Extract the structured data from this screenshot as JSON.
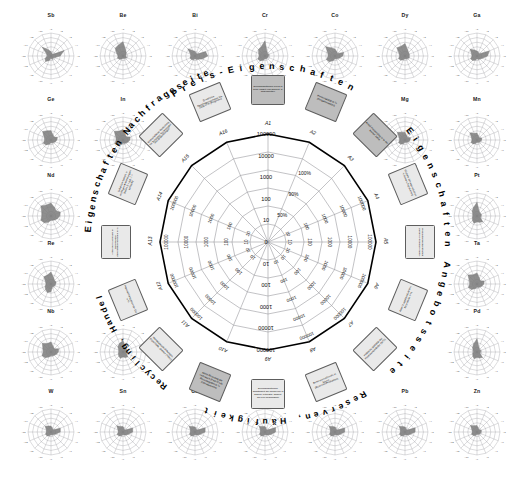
{
  "figure": {
    "caption": ""
  },
  "center_chart": {
    "quadrants": [
      {
        "id": "price",
        "label": "Preis-Eigenschaften"
      },
      {
        "id": "supply",
        "label": "Eigenschaften Angebotsseite"
      },
      {
        "id": "reserves",
        "label": "Reserven, Häufigkeit"
      },
      {
        "id": "recycling",
        "label": "Recycling, Handel"
      },
      {
        "id": "demand",
        "label": "Eigenschaften Nachfrageseite"
      }
    ],
    "axes": [
      {
        "id": "A1",
        "tick": "A1",
        "shade": "dark",
        "text": "Durchschnittlicher Preis in 1000 USD/t (log-skaliert, 3-Jahresmittel)"
      },
      {
        "id": "A2",
        "tick": "A2",
        "shade": "dark",
        "text": "Preisvolatilität in % (Dreijahresmittel)"
      },
      {
        "id": "A3",
        "tick": "A3",
        "shade": "dark",
        "text": "Anteil Preisanstieg in % der letzten Jahre"
      },
      {
        "id": "A4",
        "tick": "A4",
        "shade": "light",
        "text": "Globale Jahresproduktion in Tonnen (log-skaliert)"
      },
      {
        "id": "A5",
        "tick": "A5",
        "shade": "light",
        "text": "Produktionskonzentration Länder (Herfindahl-Index)"
      },
      {
        "id": "A6",
        "tick": "A6",
        "shade": "light",
        "text": "Anteil Kuppelproduktion / Beiprodukt in %"
      },
      {
        "id": "A7",
        "tick": "A7",
        "shade": "light",
        "text": "Politische Stabilität der Produzentenländer (WGI)"
      },
      {
        "id": "A8",
        "tick": "A8",
        "shade": "light",
        "text": "Reservenreichweite in Jahren (Reserven/Produktion)"
      },
      {
        "id": "A9",
        "tick": "A9",
        "shade": "light",
        "text": "Durchschnittlicher Schatzwert der Reserven in Jahren (Literatur, basiert, auf 100 beschränkt)"
      },
      {
        "id": "A10",
        "tick": "A10",
        "shade": "dark",
        "text": "Anteil Recycling am Verbrauch (End-of-Life Recyclingrate) in % (Literaturwerte)"
      },
      {
        "id": "A11",
        "tick": "A11",
        "shade": "light",
        "text": "Handelsbeschränkungen, Exportzolle, Quoten (Index)"
      },
      {
        "id": "A12",
        "tick": "A12",
        "shade": "light",
        "text": "Importabhängigkeit der EU in %"
      },
      {
        "id": "A13",
        "tick": "A13",
        "shade": "light",
        "text": "Anteil der Nachfrage in wachsenden Zukunftstechnologien in %"
      },
      {
        "id": "A14",
        "tick": "A14",
        "shade": "light",
        "text": "Substituierbarkeit in wichtigen Anwendungen (Index, 0 = gut, 1 = schlecht)"
      },
      {
        "id": "A15",
        "tick": "A15",
        "shade": "light",
        "text": "Wirtschaftliche Bedeutung für Schlüssel-Technologien und Anwendungen"
      },
      {
        "id": "A16",
        "tick": "A16",
        "shade": "light",
        "text": "Erwartetes Nachfragewachstum bis 2030 in % (Prognose)"
      }
    ],
    "radial_ticks_log": [
      "100000",
      "10000",
      "1000",
      "100",
      "10",
      "0"
    ],
    "radial_ticks_percent": [
      "100%",
      "90%",
      "50%"
    ],
    "radial_ticks_outer": [
      "100000",
      "10000",
      "1000",
      "100",
      "10"
    ]
  },
  "mini_charts": [
    {
      "symbol": "Sb",
      "values": [
        0.18,
        0.12,
        0.1,
        0.62,
        0.4,
        0.18,
        0.12,
        0.16,
        0.1,
        0.22,
        0.34,
        0.28,
        0.16,
        0.2,
        0.55,
        0.3
      ]
    },
    {
      "symbol": "Be",
      "values": [
        0.62,
        0.3,
        0.2,
        0.14,
        0.12,
        0.18,
        0.14,
        0.12,
        0.1,
        0.14,
        0.2,
        0.26,
        0.22,
        0.3,
        0.48,
        0.52
      ]
    },
    {
      "symbol": "Bi",
      "values": [
        0.2,
        0.14,
        0.12,
        0.5,
        0.56,
        0.34,
        0.2,
        0.16,
        0.12,
        0.18,
        0.22,
        0.24,
        0.18,
        0.22,
        0.44,
        0.26
      ]
    },
    {
      "symbol": "Cr",
      "values": [
        0.66,
        0.22,
        0.16,
        0.18,
        0.16,
        0.14,
        0.12,
        0.14,
        0.12,
        0.2,
        0.3,
        0.34,
        0.26,
        0.3,
        0.4,
        0.44
      ]
    },
    {
      "symbol": "Co",
      "values": [
        0.3,
        0.2,
        0.16,
        0.4,
        0.34,
        0.22,
        0.16,
        0.14,
        0.12,
        0.22,
        0.36,
        0.4,
        0.3,
        0.34,
        0.58,
        0.38
      ]
    },
    {
      "symbol": "Dy",
      "values": [
        0.54,
        0.3,
        0.22,
        0.2,
        0.18,
        0.2,
        0.16,
        0.14,
        0.12,
        0.18,
        0.26,
        0.3,
        0.24,
        0.28,
        0.5,
        0.46
      ]
    },
    {
      "symbol": "Ga",
      "values": [
        0.22,
        0.16,
        0.14,
        0.58,
        0.46,
        0.26,
        0.18,
        0.16,
        0.12,
        0.2,
        0.28,
        0.3,
        0.22,
        0.26,
        0.42,
        0.28
      ]
    },
    {
      "symbol": "Ge",
      "values": [
        0.4,
        0.24,
        0.18,
        0.3,
        0.26,
        0.2,
        0.16,
        0.14,
        0.12,
        0.2,
        0.3,
        0.36,
        0.28,
        0.32,
        0.52,
        0.44
      ]
    },
    {
      "symbol": "In",
      "values": [
        0.46,
        0.26,
        0.2,
        0.34,
        0.3,
        0.24,
        0.18,
        0.16,
        0.14,
        0.22,
        0.32,
        0.38,
        0.3,
        0.34,
        0.54,
        0.42
      ]
    },
    {
      "symbol": "Mg",
      "values": [
        0.34,
        0.2,
        0.16,
        0.26,
        0.22,
        0.18,
        0.14,
        0.12,
        0.1,
        0.18,
        0.26,
        0.3,
        0.24,
        0.28,
        0.48,
        0.36
      ]
    },
    {
      "symbol": "Mn",
      "values": [
        0.3,
        0.18,
        0.14,
        0.22,
        0.2,
        0.16,
        0.14,
        0.12,
        0.1,
        0.16,
        0.24,
        0.28,
        0.22,
        0.26,
        0.44,
        0.32
      ]
    },
    {
      "symbol": "Nd",
      "values": [
        0.56,
        0.4,
        0.32,
        0.44,
        0.38,
        0.3,
        0.24,
        0.2,
        0.18,
        0.3,
        0.42,
        0.48,
        0.4,
        0.44,
        0.62,
        0.52
      ]
    },
    {
      "symbol": "Pt",
      "values": [
        0.6,
        0.24,
        0.18,
        0.2,
        0.18,
        0.16,
        0.36,
        0.3,
        0.26,
        0.34,
        0.28,
        0.22,
        0.18,
        0.2,
        0.3,
        0.4
      ]
    },
    {
      "symbol": "Re",
      "values": [
        0.52,
        0.3,
        0.22,
        0.24,
        0.2,
        0.18,
        0.16,
        0.14,
        0.34,
        0.4,
        0.34,
        0.28,
        0.22,
        0.26,
        0.44,
        0.42
      ]
    },
    {
      "symbol": "Ta",
      "values": [
        0.48,
        0.28,
        0.2,
        0.34,
        0.3,
        0.24,
        0.18,
        0.16,
        0.14,
        0.22,
        0.34,
        0.4,
        0.32,
        0.36,
        0.56,
        0.44
      ]
    },
    {
      "symbol": "Nb",
      "values": [
        0.44,
        0.26,
        0.2,
        0.36,
        0.32,
        0.26,
        0.2,
        0.18,
        0.16,
        0.24,
        0.36,
        0.42,
        0.34,
        0.38,
        0.54,
        0.4
      ]
    },
    {
      "symbol": "Pd",
      "values": [
        0.58,
        0.22,
        0.16,
        0.18,
        0.16,
        0.14,
        0.34,
        0.28,
        0.24,
        0.32,
        0.26,
        0.2,
        0.16,
        0.18,
        0.28,
        0.38
      ]
    },
    {
      "symbol": "Rh",
      "values": [
        0.5,
        0.24,
        0.18,
        0.2,
        0.18,
        0.16,
        0.3,
        0.26,
        0.22,
        0.3,
        0.26,
        0.22,
        0.18,
        0.2,
        0.32,
        0.4
      ]
    },
    {
      "symbol": "Zn",
      "values": [
        0.28,
        0.16,
        0.14,
        0.2,
        0.18,
        0.16,
        0.14,
        0.12,
        0.1,
        0.16,
        0.22,
        0.26,
        0.2,
        0.24,
        0.4,
        0.3
      ]
    },
    {
      "symbol": "W",
      "values": [
        0.26,
        0.16,
        0.14,
        0.44,
        0.4,
        0.24,
        0.16,
        0.14,
        0.12,
        0.18,
        0.24,
        0.26,
        0.2,
        0.22,
        0.36,
        0.28
      ]
    },
    {
      "symbol": "Sn",
      "values": [
        0.24,
        0.14,
        0.12,
        0.46,
        0.42,
        0.26,
        0.18,
        0.14,
        0.12,
        0.18,
        0.24,
        0.28,
        0.2,
        0.24,
        0.38,
        0.26
      ]
    },
    {
      "symbol": "Cu",
      "values": [
        0.22,
        0.14,
        0.12,
        0.48,
        0.44,
        0.26,
        0.18,
        0.14,
        0.12,
        0.18,
        0.24,
        0.26,
        0.2,
        0.22,
        0.36,
        0.26
      ]
    },
    {
      "symbol": "Al",
      "values": [
        0.24,
        0.14,
        0.12,
        0.5,
        0.46,
        0.28,
        0.18,
        0.14,
        0.12,
        0.18,
        0.24,
        0.26,
        0.2,
        0.22,
        0.36,
        0.26
      ]
    },
    {
      "symbol": "Ni",
      "values": [
        0.22,
        0.14,
        0.12,
        0.46,
        0.42,
        0.26,
        0.18,
        0.14,
        0.12,
        0.18,
        0.24,
        0.26,
        0.2,
        0.22,
        0.36,
        0.26
      ]
    },
    {
      "symbol": "Pb",
      "values": [
        0.22,
        0.14,
        0.12,
        0.48,
        0.44,
        0.26,
        0.18,
        0.14,
        0.12,
        0.18,
        0.24,
        0.26,
        0.2,
        0.22,
        0.36,
        0.26
      ]
    }
  ],
  "mini_axis_labels": [
    "A1",
    "A2",
    "A3",
    "A4",
    "A5",
    "A6",
    "A7",
    "A8",
    "A9",
    "A10",
    "A11",
    "A12",
    "A13",
    "A14",
    "A15",
    "A16"
  ],
  "colors": {
    "series_fill": "#7b7b7b",
    "grid": "#9a9aa0",
    "outline": "#000000",
    "card_light": "#e9e9e9",
    "card_dark": "#bdbdbd"
  }
}
